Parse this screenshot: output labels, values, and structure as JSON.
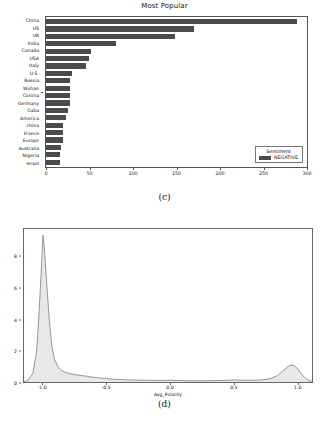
{
  "figure": {
    "panels": [
      {
        "caption": "(c)"
      },
      {
        "caption": "(d)"
      }
    ]
  },
  "panel_c": {
    "legend_title": "Sentiment",
    "legend_entry": "NEGATIVE",
    "bar_color": "#4b4b4b"
  },
  "panel_d": {
    "line_color": "#8a8a8a",
    "fill_color": "#e8e8e8"
  },
  "chart_data": [
    {
      "type": "bar",
      "orientation": "horizontal",
      "title": "Most Popular",
      "xlabel": "",
      "ylabel": "",
      "xlim": [
        0,
        300
      ],
      "xticks": [
        0,
        50,
        100,
        150,
        200,
        250,
        300
      ],
      "grid": false,
      "legend": {
        "title": "Sentiment",
        "entries": [
          "NEGATIVE"
        ],
        "position": "lower right"
      },
      "categories": [
        "China",
        "US",
        "UK",
        "India",
        "Canada",
        "USA",
        "Italy",
        "U.S.",
        "Russia",
        "Wuhan",
        "Corona",
        "Germany",
        "Cuba",
        "America",
        "china",
        "France",
        "Europe",
        "Australia",
        "Nigeria",
        "Israel"
      ],
      "values": [
        289,
        170,
        148,
        81,
        52,
        49,
        46,
        30,
        28,
        28,
        28,
        28,
        25,
        23,
        20,
        20,
        20,
        17,
        16,
        16
      ],
      "series": [
        {
          "name": "NEGATIVE",
          "values": [
            289,
            170,
            148,
            81,
            52,
            49,
            46,
            30,
            28,
            28,
            28,
            28,
            25,
            23,
            20,
            20,
            20,
            17,
            16,
            16
          ]
        }
      ]
    },
    {
      "type": "area",
      "subtype": "kde-density",
      "title": "",
      "xlabel": "Avg_Polarity",
      "ylabel": "",
      "xlim": [
        -1.15,
        1.12
      ],
      "ylim": [
        0,
        9.8
      ],
      "xticks": [
        -1.0,
        -0.5,
        0.0,
        0.5,
        1.0
      ],
      "yticks": [
        0,
        2,
        4,
        6,
        8
      ],
      "grid": false,
      "x": [
        -1.15,
        -1.12,
        -1.08,
        -1.05,
        -1.03,
        -1.01,
        -1.0,
        -0.99,
        -0.97,
        -0.95,
        -0.93,
        -0.91,
        -0.88,
        -0.85,
        -0.82,
        -0.78,
        -0.74,
        -0.7,
        -0.65,
        -0.6,
        -0.55,
        -0.5,
        -0.45,
        -0.4,
        -0.35,
        -0.3,
        -0.25,
        -0.2,
        -0.15,
        -0.1,
        -0.05,
        0.0,
        0.05,
        0.1,
        0.15,
        0.2,
        0.25,
        0.3,
        0.35,
        0.4,
        0.45,
        0.5,
        0.55,
        0.6,
        0.65,
        0.7,
        0.75,
        0.8,
        0.85,
        0.9,
        0.94,
        0.97,
        1.0,
        1.03,
        1.06,
        1.09,
        1.12
      ],
      "y": [
        0.02,
        0.1,
        0.55,
        2.0,
        4.6,
        7.8,
        9.4,
        8.6,
        6.2,
        3.9,
        2.3,
        1.45,
        0.95,
        0.72,
        0.6,
        0.52,
        0.46,
        0.42,
        0.36,
        0.3,
        0.26,
        0.22,
        0.18,
        0.16,
        0.14,
        0.13,
        0.12,
        0.11,
        0.11,
        0.1,
        0.1,
        0.12,
        0.1,
        0.09,
        0.08,
        0.08,
        0.08,
        0.08,
        0.09,
        0.1,
        0.11,
        0.13,
        0.12,
        0.11,
        0.11,
        0.12,
        0.16,
        0.24,
        0.42,
        0.78,
        1.05,
        1.08,
        0.92,
        0.58,
        0.3,
        0.12,
        0.03
      ],
      "peaks": [
        {
          "x": -1.0,
          "y": 9.4
        },
        {
          "x": 0.97,
          "y": 1.08
        }
      ]
    }
  ]
}
